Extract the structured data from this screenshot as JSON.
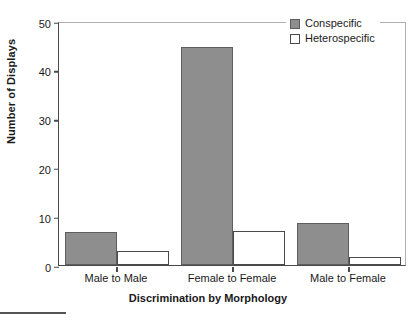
{
  "chart_data": {
    "type": "bar",
    "title": "",
    "xlabel": "Discrimination by Morphology",
    "ylabel": "Number of Displays",
    "categories": [
      "Male to Male",
      "Female to Female",
      "Male to Female"
    ],
    "series": [
      {
        "name": "Conspecific",
        "color": "#8e8e8e",
        "values": [
          6.8,
          44.6,
          8.6
        ]
      },
      {
        "name": "Heterospecific",
        "color": "#ffffff",
        "values": [
          2.9,
          7.0,
          1.7
        ]
      }
    ],
    "ylim": [
      0,
      50
    ],
    "yticks": [
      0,
      10,
      20,
      30,
      40,
      50
    ],
    "ytick_labels": [
      "0",
      "10",
      "20",
      "30",
      "40",
      "50"
    ],
    "grid": false,
    "legend_position": "top-right"
  },
  "legend": {
    "entries": [
      {
        "label": "Conspecific"
      },
      {
        "label": "Heterospecific"
      }
    ]
  }
}
